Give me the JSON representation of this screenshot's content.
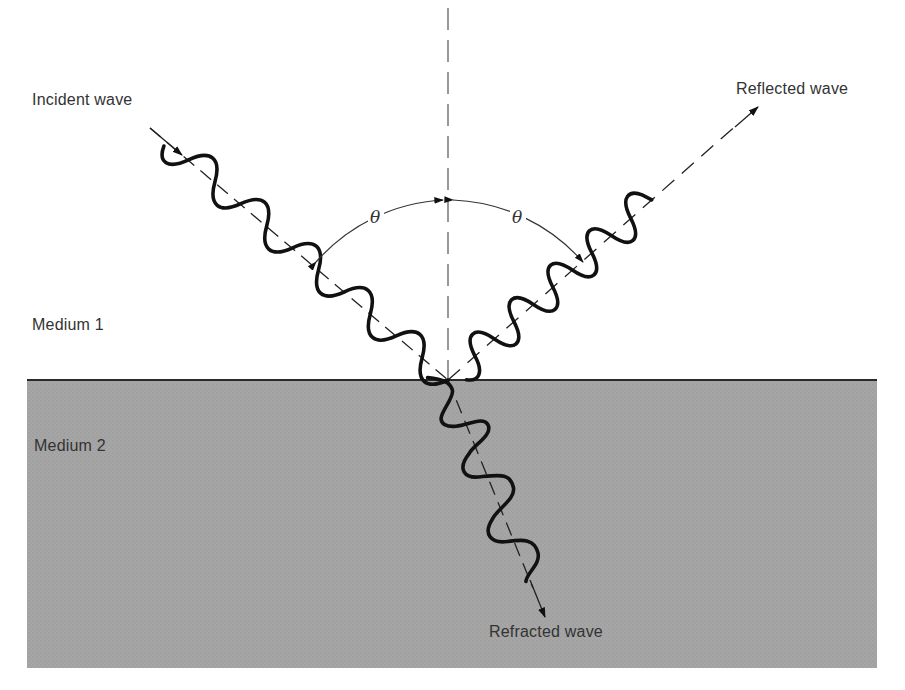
{
  "diagram": {
    "labels": {
      "incident": "Incident wave",
      "reflected": "Reflected wave",
      "refracted": "Refracted wave",
      "medium1": "Medium 1",
      "medium2": "Medium 2",
      "angle_incident": "θ",
      "angle_reflected": "θ"
    },
    "colors": {
      "background": "#ffffff",
      "medium2_fill": "#a3a3a3",
      "interface_line": "#2a2a2a",
      "wave_stroke": "#111111",
      "dashed_line": "#333333",
      "text": "#333333"
    },
    "geometry": {
      "point_of_incidence": [
        448,
        380
      ],
      "incident_start": [
        148,
        130
      ],
      "reflected_end": [
        757,
        108
      ],
      "refracted_end": [
        545,
        615
      ]
    }
  }
}
